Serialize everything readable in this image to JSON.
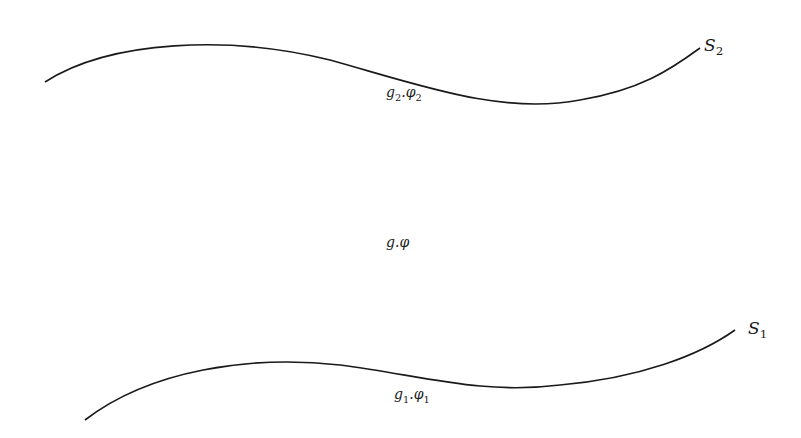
{
  "diagram": {
    "surfaces": [
      {
        "id": "S2",
        "name": "S",
        "sub": "2",
        "field_g": "g",
        "field_phi": "φ",
        "field_sub": "2"
      },
      {
        "id": "S1",
        "name": "S",
        "sub": "1",
        "field_g": "g",
        "field_phi": "φ",
        "field_sub": "1"
      }
    ],
    "bulk": {
      "g": "g",
      "sep": ".",
      "phi": "φ"
    },
    "sep": ".",
    "stroke_color": "#1a1a1a"
  }
}
